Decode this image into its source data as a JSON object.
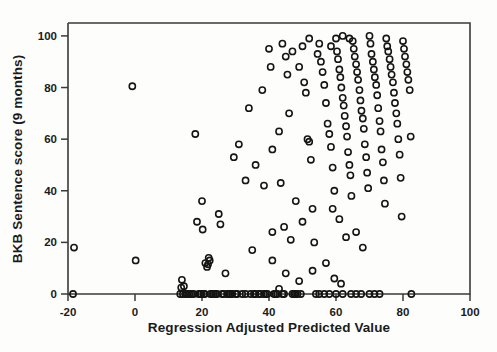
{
  "chart_data": {
    "type": "scatter",
    "title": "",
    "xlabel": "Regression Adjusted Predicted Value",
    "ylabel": "BKB Sentence score (9 months)",
    "xlim": [
      -20,
      100
    ],
    "ylim": [
      0,
      105
    ],
    "xticks": [
      -20,
      0,
      20,
      40,
      60,
      80,
      100
    ],
    "xtick_labels": [
      "-20",
      "0",
      "20",
      "40",
      "60",
      "80",
      "100"
    ],
    "yticks": [
      0,
      20,
      40,
      60,
      80,
      100
    ],
    "ytick_labels": [
      "0",
      "20",
      "40",
      "60",
      "80",
      "100"
    ],
    "grid": false,
    "legend": null,
    "marker": "open-circle",
    "marker_color": "#151515",
    "n_points": 196,
    "points": [
      [
        -18.2,
        18.0
      ],
      [
        -18.5,
        0.0
      ],
      [
        -0.8,
        80.5
      ],
      [
        0.2,
        13.0
      ],
      [
        13.5,
        0.0
      ],
      [
        13.8,
        2.5
      ],
      [
        14.0,
        5.5
      ],
      [
        14.3,
        0.0
      ],
      [
        14.6,
        3.0
      ],
      [
        15.0,
        0.0
      ],
      [
        15.5,
        0.0
      ],
      [
        16.2,
        0.0
      ],
      [
        16.8,
        0.0
      ],
      [
        17.5,
        0.0
      ],
      [
        18.0,
        62.0
      ],
      [
        18.5,
        28.0
      ],
      [
        19.0,
        0.0
      ],
      [
        19.5,
        0.0
      ],
      [
        19.8,
        0.0
      ],
      [
        20.0,
        36.0
      ],
      [
        20.2,
        25.0
      ],
      [
        20.5,
        0.0
      ],
      [
        20.8,
        0.0
      ],
      [
        21.0,
        12.0
      ],
      [
        21.5,
        10.5
      ],
      [
        21.8,
        11.5
      ],
      [
        22.0,
        14.0
      ],
      [
        22.3,
        13.0
      ],
      [
        22.5,
        0.0
      ],
      [
        23.0,
        0.0
      ],
      [
        23.5,
        0.0
      ],
      [
        24.0,
        0.0
      ],
      [
        24.5,
        0.0
      ],
      [
        25.0,
        31.0
      ],
      [
        25.5,
        27.0
      ],
      [
        26.0,
        0.0
      ],
      [
        26.5,
        0.0
      ],
      [
        27.0,
        8.0
      ],
      [
        27.5,
        0.0
      ],
      [
        28.0,
        0.0
      ],
      [
        28.5,
        0.0
      ],
      [
        29.0,
        0.0
      ],
      [
        30.0,
        0.0
      ],
      [
        30.5,
        0.0
      ],
      [
        31.0,
        58.0
      ],
      [
        32.0,
        0.0
      ],
      [
        33.0,
        0.0
      ],
      [
        34.0,
        72.0
      ],
      [
        34.5,
        0.0
      ],
      [
        35.0,
        17.0
      ],
      [
        35.5,
        0.0
      ],
      [
        36.0,
        0.0
      ],
      [
        37.0,
        0.0
      ],
      [
        37.5,
        0.0
      ],
      [
        38.0,
        79.0
      ],
      [
        38.5,
        0.0
      ],
      [
        39.0,
        0.0
      ],
      [
        39.5,
        0.0
      ],
      [
        40.0,
        95.0
      ],
      [
        40.5,
        88.0
      ],
      [
        41.0,
        56.0
      ],
      [
        41.5,
        0.0
      ],
      [
        42.0,
        0.0
      ],
      [
        42.5,
        0.0
      ],
      [
        43.0,
        63.0
      ],
      [
        43.5,
        43.0
      ],
      [
        44.0,
        0.0
      ],
      [
        44.5,
        0.0
      ],
      [
        45.0,
        92.0
      ],
      [
        45.5,
        85.0
      ],
      [
        46.0,
        70.0
      ],
      [
        46.5,
        21.0
      ],
      [
        47.0,
        0.0
      ],
      [
        47.5,
        0.0
      ],
      [
        48.0,
        0.0
      ],
      [
        48.5,
        0.0
      ],
      [
        49.0,
        88.0
      ],
      [
        49.5,
        0.0
      ],
      [
        50.0,
        96.0
      ],
      [
        50.5,
        82.0
      ],
      [
        51.0,
        78.0
      ],
      [
        51.5,
        60.0
      ],
      [
        52.0,
        59.0
      ],
      [
        52.5,
        52.0
      ],
      [
        53.0,
        33.0
      ],
      [
        53.5,
        20.0
      ],
      [
        54.0,
        0.0
      ],
      [
        55.0,
        97.0
      ],
      [
        55.5,
        90.0
      ],
      [
        56.0,
        86.0
      ],
      [
        56.5,
        81.0
      ],
      [
        57.0,
        74.0
      ],
      [
        57.5,
        66.0
      ],
      [
        58.0,
        62.0
      ],
      [
        58.5,
        57.0
      ],
      [
        59.0,
        49.0
      ],
      [
        59.5,
        40.0
      ],
      [
        60.0,
        99.0
      ],
      [
        60.3,
        94.0
      ],
      [
        60.6,
        91.0
      ],
      [
        61.0,
        87.0
      ],
      [
        61.3,
        84.0
      ],
      [
        61.6,
        80.0
      ],
      [
        62.0,
        76.0
      ],
      [
        62.3,
        73.0
      ],
      [
        62.6,
        69.0
      ],
      [
        63.0,
        65.0
      ],
      [
        63.3,
        61.0
      ],
      [
        63.6,
        55.0
      ],
      [
        64.0,
        50.0
      ],
      [
        64.3,
        46.0
      ],
      [
        64.6,
        38.0
      ],
      [
        65.0,
        98.0
      ],
      [
        65.3,
        95.0
      ],
      [
        65.6,
        92.0
      ],
      [
        66.0,
        89.0
      ],
      [
        66.3,
        86.0
      ],
      [
        66.6,
        83.0
      ],
      [
        67.0,
        79.0
      ],
      [
        67.3,
        75.0
      ],
      [
        67.6,
        71.0
      ],
      [
        68.0,
        68.0
      ],
      [
        68.3,
        64.0
      ],
      [
        68.6,
        58.0
      ],
      [
        69.0,
        53.0
      ],
      [
        69.3,
        47.0
      ],
      [
        69.6,
        41.0
      ],
      [
        70.0,
        100.0
      ],
      [
        70.3,
        97.0
      ],
      [
        70.6,
        93.0
      ],
      [
        71.0,
        90.0
      ],
      [
        71.3,
        87.0
      ],
      [
        71.6,
        84.0
      ],
      [
        72.0,
        81.0
      ],
      [
        72.3,
        77.0
      ],
      [
        72.6,
        72.0
      ],
      [
        73.0,
        67.0
      ],
      [
        73.3,
        63.0
      ],
      [
        73.6,
        56.0
      ],
      [
        74.0,
        51.0
      ],
      [
        74.3,
        44.0
      ],
      [
        74.6,
        35.0
      ],
      [
        75.0,
        99.0
      ],
      [
        75.3,
        96.0
      ],
      [
        75.6,
        94.0
      ],
      [
        76.0,
        91.0
      ],
      [
        76.3,
        88.0
      ],
      [
        76.6,
        85.0
      ],
      [
        77.0,
        82.0
      ],
      [
        77.3,
        78.0
      ],
      [
        77.6,
        74.0
      ],
      [
        78.0,
        70.0
      ],
      [
        78.3,
        66.0
      ],
      [
        78.6,
        60.0
      ],
      [
        79.0,
        54.0
      ],
      [
        79.3,
        45.0
      ],
      [
        79.6,
        30.0
      ],
      [
        80.0,
        98.0
      ],
      [
        80.3,
        95.0
      ],
      [
        80.6,
        92.0
      ],
      [
        81.0,
        89.0
      ],
      [
        81.3,
        86.0
      ],
      [
        81.6,
        83.0
      ],
      [
        82.0,
        79.0
      ],
      [
        82.3,
        61.0
      ],
      [
        82.5,
        0.0
      ],
      [
        44.0,
        97.0
      ],
      [
        47.0,
        94.0
      ],
      [
        52.0,
        99.0
      ],
      [
        54.5,
        93.0
      ],
      [
        58.5,
        96.0
      ],
      [
        62.0,
        100.0
      ],
      [
        64.0,
        99.0
      ],
      [
        59.0,
        33.0
      ],
      [
        61.0,
        29.0
      ],
      [
        63.0,
        22.0
      ],
      [
        66.0,
        24.0
      ],
      [
        68.0,
        18.0
      ],
      [
        57.0,
        12.0
      ],
      [
        59.5,
        6.0
      ],
      [
        61.5,
        4.0
      ],
      [
        55.0,
        0.0
      ],
      [
        56.5,
        0.0
      ],
      [
        58.0,
        0.0
      ],
      [
        60.0,
        0.0
      ],
      [
        62.0,
        0.0
      ],
      [
        64.5,
        0.0
      ],
      [
        66.0,
        0.0
      ],
      [
        67.5,
        0.0
      ],
      [
        70.0,
        0.0
      ],
      [
        71.5,
        0.0
      ],
      [
        73.0,
        0.0
      ],
      [
        48.0,
        36.0
      ],
      [
        50.0,
        28.0
      ],
      [
        44.5,
        26.0
      ],
      [
        41.0,
        24.0
      ],
      [
        38.5,
        42.0
      ],
      [
        36.0,
        50.0
      ],
      [
        33.0,
        44.0
      ],
      [
        29.5,
        53.0
      ],
      [
        45.0,
        8.0
      ],
      [
        49.0,
        5.0
      ],
      [
        53.0,
        9.0
      ],
      [
        41.0,
        13.0
      ],
      [
        43.0,
        2.0
      ]
    ]
  },
  "axes": {
    "xlabel_name": "x-axis-title",
    "ylabel_name": "y-axis-title"
  }
}
